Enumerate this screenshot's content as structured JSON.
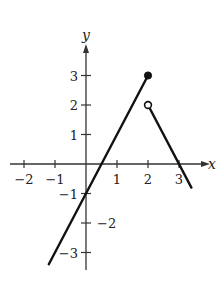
{
  "chart_data": {
    "type": "line",
    "title": "",
    "xlabel": "x",
    "ylabel": "y",
    "xlim": [
      -2.2,
      3.9
    ],
    "ylim": [
      -3.6,
      3.9
    ],
    "grid": false,
    "x_ticks": [
      -2,
      -1,
      1,
      2,
      3
    ],
    "y_ticks": [
      3,
      2,
      1,
      -1,
      -2,
      -3
    ],
    "x_tick_labels": [
      "−2",
      "−1",
      "1",
      "2",
      "3"
    ],
    "y_tick_labels": [
      "3",
      "2",
      "1",
      "−1",
      "−2",
      "−3"
    ],
    "series": [
      {
        "name": "segment-1",
        "equation": "y = 2x - 1",
        "x": [
          -1.2,
          2
        ],
        "y": [
          -3.4,
          3
        ],
        "end_marker": "closed",
        "end_point": [
          2,
          3
        ]
      },
      {
        "name": "segment-2",
        "equation": "y = -2x + 6",
        "x": [
          2,
          3.4
        ],
        "y": [
          2,
          -0.8
        ],
        "start_marker": "open",
        "start_point": [
          2,
          2
        ]
      }
    ]
  }
}
